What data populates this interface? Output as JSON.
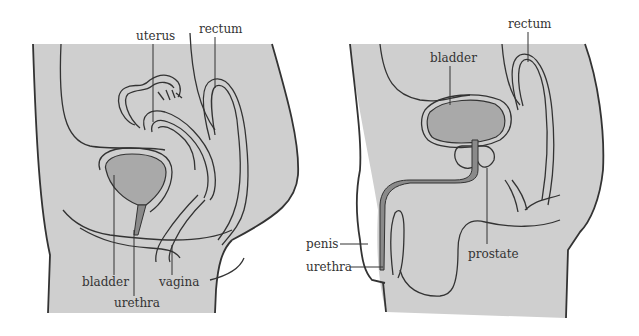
{
  "colors": {
    "body_fill": "#cfcfcf",
    "organ_fill": "#a9a9a9",
    "urethra_fill": "#8a8a8a",
    "line": "#333333"
  },
  "female": {
    "labels": {
      "uterus": "uterus",
      "rectum": "rectum",
      "bladder": "bladder",
      "urethra": "urethra",
      "vagina": "vagina"
    }
  },
  "male": {
    "labels": {
      "rectum": "rectum",
      "bladder": "bladder",
      "penis": "penis",
      "urethra": "urethra",
      "prostate": "prostate"
    }
  }
}
